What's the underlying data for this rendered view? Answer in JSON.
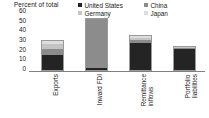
{
  "chart_data": {
    "type": "bar",
    "title": "",
    "ylabel": "Percent of total",
    "xlabel": "",
    "ylim": [
      0,
      60
    ],
    "yticks": [
      0,
      10,
      20,
      30,
      40,
      50,
      60
    ],
    "grid": false,
    "stacked": true,
    "legend_position": "top-right",
    "categories": [
      "Exports",
      "Inward FDI",
      "Remittance inflows",
      "Portfolio liabilities"
    ],
    "series": [
      {
        "name": "United States",
        "color": "#242424",
        "values": [
          16,
          2,
          28,
          22
        ]
      },
      {
        "name": "China",
        "color": "#8c8c8c",
        "values": [
          6,
          51,
          3,
          1
        ]
      },
      {
        "name": "Germany",
        "color": "#c4c4c4",
        "values": [
          5,
          0,
          2,
          1
        ]
      },
      {
        "name": "Japan",
        "color": "#dedede",
        "values": [
          3,
          0,
          2,
          0
        ]
      }
    ],
    "totals": [
      30,
      53,
      35,
      24
    ]
  },
  "axis": {
    "title": "Percent of total",
    "ticks": [
      "60",
      "50",
      "40",
      "30",
      "20",
      "10",
      "0"
    ]
  },
  "legend": {
    "items": [
      {
        "label": "United States",
        "color": "#242424"
      },
      {
        "label": "China",
        "color": "#8c8c8c"
      },
      {
        "label": "Germany",
        "color": "#c4c4c4"
      },
      {
        "label": "Japan",
        "color": "#dedede"
      }
    ]
  },
  "categories": [
    {
      "label": "Exports"
    },
    {
      "label": "Inward FDI"
    },
    {
      "label": "Remittance\ninflows"
    },
    {
      "label": "Portfolio\nliabilities"
    }
  ]
}
